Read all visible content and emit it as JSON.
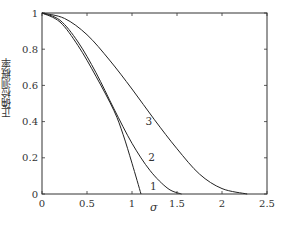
{
  "chart_data": {
    "type": "line",
    "title": "",
    "xlabel": "σ",
    "ylabel": "正确检测概率",
    "xlim": [
      0,
      2.5
    ],
    "ylim": [
      0,
      1
    ],
    "xticks": [
      "0",
      "0.5",
      "1",
      "1.5",
      "2",
      "2.5"
    ],
    "yticks": [
      "0",
      "0.2",
      "0.4",
      "0.6",
      "0.8",
      "1"
    ],
    "grid": false,
    "legend": "inline curve labels",
    "series": [
      {
        "name": "1",
        "x": [
          0,
          0.2,
          0.4,
          0.6,
          0.8,
          0.9,
          1.0,
          1.1
        ],
        "y": [
          1.0,
          0.95,
          0.82,
          0.65,
          0.46,
          0.33,
          0.17,
          0.0
        ]
      },
      {
        "name": "2",
        "x": [
          0,
          0.2,
          0.4,
          0.6,
          0.8,
          1.0,
          1.2,
          1.4,
          1.55
        ],
        "y": [
          1.0,
          0.96,
          0.84,
          0.67,
          0.47,
          0.28,
          0.13,
          0.03,
          0.0
        ]
      },
      {
        "name": "3",
        "x": [
          0,
          0.25,
          0.5,
          0.75,
          1.0,
          1.25,
          1.5,
          1.75,
          2.0,
          2.28
        ],
        "y": [
          1.0,
          0.97,
          0.88,
          0.74,
          0.58,
          0.41,
          0.25,
          0.11,
          0.03,
          0.0
        ]
      }
    ],
    "curve_labels": [
      {
        "text": "1",
        "x": 1.2,
        "y": 0.02
      },
      {
        "text": "2",
        "x": 1.18,
        "y": 0.18
      },
      {
        "text": "3",
        "x": 1.15,
        "y": 0.38
      }
    ]
  },
  "axes": {
    "x_label": "σ",
    "y_label": "正确检测概率"
  }
}
